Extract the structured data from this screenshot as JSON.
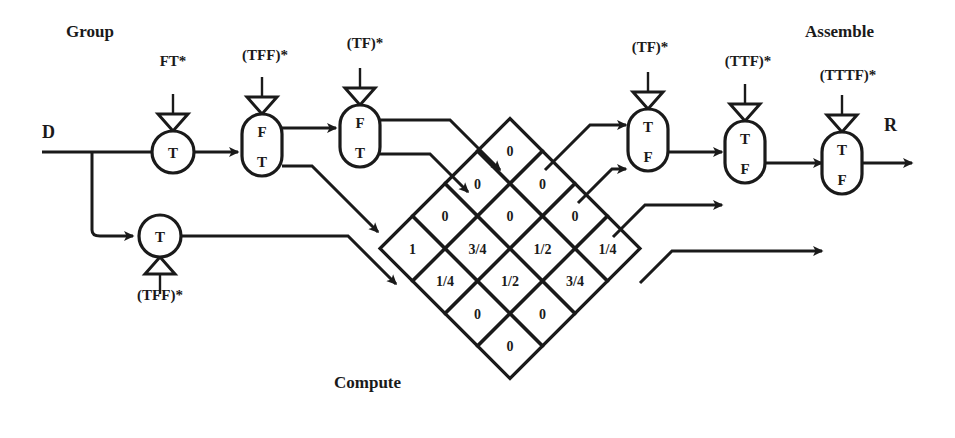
{
  "diagram": {
    "title_labels": {
      "group": "Group",
      "assemble": "Assemble",
      "compute": "Compute"
    },
    "io": {
      "input": "D",
      "output": "R"
    },
    "group_nodes": [
      {
        "id": "g1",
        "shape": "circle",
        "labels": [
          "T"
        ],
        "port": "FT*",
        "port_dir": "down",
        "cx": 173,
        "cy": 152,
        "r": 21
      },
      {
        "id": "g2",
        "shape": "capsule",
        "labels": [
          "F",
          "T"
        ],
        "port": "(TFF)*",
        "port_dir": "down",
        "cx": 262,
        "cy": 145,
        "w": 40,
        "h": 62
      },
      {
        "id": "g3",
        "shape": "capsule",
        "labels": [
          "F",
          "T"
        ],
        "port": "(TF)*",
        "port_dir": "down",
        "cx": 360,
        "cy": 136,
        "w": 40,
        "h": 62
      },
      {
        "id": "g4",
        "shape": "circle",
        "labels": [
          "T"
        ],
        "port": "(TFF)*",
        "port_dir": "up",
        "cx": 160,
        "cy": 236,
        "r": 21
      }
    ],
    "assemble_nodes": [
      {
        "id": "a1",
        "shape": "capsule",
        "labels": [
          "T",
          "F"
        ],
        "port": "(TF)*",
        "port_dir": "down",
        "cx": 648,
        "cy": 140,
        "w": 40,
        "h": 62
      },
      {
        "id": "a2",
        "shape": "capsule",
        "labels": [
          "T",
          "F"
        ],
        "port": "(TTF)*",
        "port_dir": "down",
        "cx": 745,
        "cy": 152,
        "w": 40,
        "h": 62
      },
      {
        "id": "a3",
        "shape": "capsule",
        "labels": [
          "T",
          "F"
        ],
        "port": "(TTTF)*",
        "port_dir": "down",
        "cx": 842,
        "cy": 163,
        "w": 40,
        "h": 62
      }
    ],
    "port_labels": [
      {
        "text": "FT*",
        "x": 173,
        "y": 66
      },
      {
        "text": "(TFF)*",
        "x": 265,
        "y": 60
      },
      {
        "text": "(TF)*",
        "x": 365,
        "y": 48
      },
      {
        "text": "(TFF)*",
        "x": 160,
        "y": 300
      },
      {
        "text": "(TF)*",
        "x": 650,
        "y": 52
      },
      {
        "text": "(TTF)*",
        "x": 748,
        "y": 66
      },
      {
        "text": "(TTTF)*",
        "x": 848,
        "y": 80
      }
    ],
    "compute_grid": {
      "center_x": 510,
      "center_y": 281,
      "cell_half": 32.5,
      "rows": [
        {
          "offset": -4,
          "cells": [
            "0"
          ]
        },
        {
          "offset": -3,
          "cells": [
            "0",
            "0"
          ]
        },
        {
          "offset": -2,
          "cells": [
            "0",
            "0",
            "0"
          ]
        },
        {
          "offset": -1,
          "cells": [
            "1",
            "3/4",
            "1/2",
            "1/4"
          ]
        },
        {
          "offset": 0,
          "cells": [
            "1/4",
            "1/2",
            "3/4"
          ]
        },
        {
          "offset": 1,
          "cells": [
            "0",
            "0"
          ]
        },
        {
          "offset": 2,
          "cells": [
            "0"
          ]
        }
      ]
    },
    "chart_data": {
      "type": "table",
      "title": "Compute diamond array values",
      "note": "Diagonal lattice of cells; each sub-array lists one diagonal row top-to-bottom",
      "rows": [
        [
          "0"
        ],
        [
          "0",
          "0"
        ],
        [
          "0",
          "0",
          "0"
        ],
        [
          "1",
          "3/4",
          "1/2",
          "1/4"
        ],
        [
          "1/4",
          "1/2",
          "3/4"
        ],
        [
          "0",
          "0"
        ],
        [
          "0"
        ]
      ]
    }
  }
}
